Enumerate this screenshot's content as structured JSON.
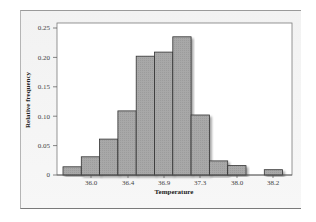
{
  "chart_data": {
    "type": "bar",
    "title": "",
    "xlabel": "Temperature",
    "ylabel": "Relative frequency",
    "ylim": [
      0,
      0.25
    ],
    "yticks": [
      "0",
      "0.05",
      "0.10",
      "0.15",
      "0.20",
      "0.25"
    ],
    "xticks": [
      "36.0",
      "36.4",
      "36.9",
      "37.3",
      "38.0",
      "38.2"
    ],
    "grid": false,
    "legend": null,
    "bins": [
      {
        "index": 0,
        "value": 0.014
      },
      {
        "index": 1,
        "value": 0.031
      },
      {
        "index": 2,
        "value": 0.061
      },
      {
        "index": 3,
        "value": 0.109
      },
      {
        "index": 4,
        "value": 0.202
      },
      {
        "index": 5,
        "value": 0.209
      },
      {
        "index": 6,
        "value": 0.235
      },
      {
        "index": 7,
        "value": 0.102
      },
      {
        "index": 8,
        "value": 0.024
      },
      {
        "index": 9,
        "value": 0.016
      },
      {
        "index": 10,
        "value": 0.0
      },
      {
        "index": 11,
        "value": 0.009
      }
    ],
    "values": [
      0.014,
      0.031,
      0.061,
      0.109,
      0.202,
      0.209,
      0.235,
      0.102,
      0.024,
      0.016,
      0.0,
      0.009
    ],
    "bar_color": "#a9a9a9",
    "edge_color": "#333333"
  }
}
